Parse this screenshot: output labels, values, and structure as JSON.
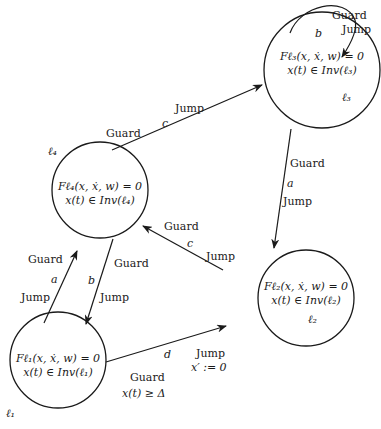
{
  "diagram": {
    "type": "hybrid-automaton",
    "locations": [
      {
        "id": "l1",
        "name": "ℓ1",
        "flow": "Fℓ₁(x, ẋ, w) = 0",
        "invariant": "x(t) ∈ Inv(ℓ₁)"
      },
      {
        "id": "l2",
        "name": "ℓ2",
        "flow": "Fℓ₂(x, ẋ, w) = 0",
        "invariant": "x(t) ∈ Inv(ℓ₂)"
      },
      {
        "id": "l3",
        "name": "ℓ3",
        "flow": "Fℓ₃(x, ẋ, w) = 0",
        "invariant": "x(t) ∈ Inv(ℓ₃)"
      },
      {
        "id": "l4",
        "name": "ℓ4",
        "flow": "Fℓ₄(x, ẋ, w) = 0",
        "invariant": "x(t) ∈ Inv(ℓ₄)"
      }
    ],
    "location_labels": {
      "l1": "ℓ₁",
      "l2": "ℓ₂",
      "l3": "ℓ₃",
      "l4": "ℓ₄"
    },
    "edges": [
      {
        "from": "l1",
        "to": "l4",
        "event": "a",
        "guard": "Guard",
        "jump": "Jump"
      },
      {
        "from": "l4",
        "to": "l1",
        "event": "b",
        "guard": "Guard",
        "jump": "Jump"
      },
      {
        "from": "l4",
        "to": "l3",
        "event": "c",
        "guard": "Guard",
        "jump": "Jump"
      },
      {
        "from": "l3",
        "to": "l3",
        "event": "b",
        "guard": "Guard",
        "jump": "Jump"
      },
      {
        "from": "l3",
        "to": "l2",
        "event": "a",
        "guard": "Guard",
        "jump": "Jump"
      },
      {
        "from": "l2",
        "to": "l4",
        "event": "c",
        "guard": "Guard",
        "jump": "Jump"
      },
      {
        "from": "l1",
        "to": "l2",
        "event": "d",
        "guard": "Guard",
        "guard_condition": "x(t) ≥ Δ",
        "jump": "Jump",
        "jump_reset": "x′ := 0"
      }
    ]
  }
}
